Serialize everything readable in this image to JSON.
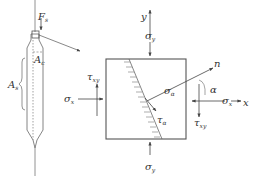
{
  "diagram": {
    "type": "mechanics-stress-element",
    "specimen": {
      "force_label": {
        "main": "F",
        "sub": "s"
      },
      "cross_section_label": {
        "main": "A",
        "sub": "c"
      },
      "side_area_label": {
        "main": "A",
        "sub": "s"
      }
    },
    "element": {
      "axes": {
        "x": "x",
        "y": "y"
      },
      "sigma_x": {
        "main": "σ",
        "sub": "x"
      },
      "sigma_y_top": {
        "main": "σ",
        "sub": "y"
      },
      "sigma_y_bottom": {
        "main": "σ",
        "sub": "y"
      },
      "sigma_x_right": {
        "main": "σ",
        "sub": "x"
      },
      "tau_xy_left": {
        "main": "τ",
        "sub": "xy"
      },
      "tau_xy_right": {
        "main": "τ",
        "sub": "xy"
      },
      "sigma_alpha": {
        "main": "σ",
        "sub": "α"
      },
      "tau_alpha": {
        "main": "τ",
        "sub": "α"
      },
      "normal": "n",
      "angle": "α"
    },
    "colors": {
      "stroke": "#555555",
      "text": "#333333"
    }
  }
}
